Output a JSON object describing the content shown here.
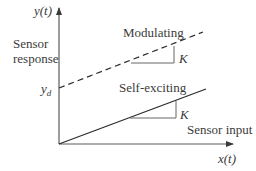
{
  "diagram": {
    "type": "sensor-response-comparison",
    "axes": {
      "y_label": "y(t)",
      "y_description": [
        "Sensor",
        "response"
      ],
      "x_label": "x(t)",
      "x_description": "Sensor input",
      "intercept_label_main": "y",
      "intercept_label_sub": "d"
    },
    "lines": [
      {
        "name": "Modulating",
        "style": "dashed",
        "start": [
          59,
          88
        ],
        "end": [
          203,
          32
        ],
        "slope_label": "K",
        "slope_triangle": {
          "x1": 131,
          "x2": 174,
          "y_base": 63,
          "y_top": 46
        }
      },
      {
        "name": "Self-exciting",
        "style": "solid",
        "start": [
          59,
          144
        ],
        "end": [
          206,
          89
        ],
        "slope_label": "K",
        "slope_triangle": {
          "x1": 130,
          "x2": 176,
          "y_base": 118,
          "y_top": 101
        }
      }
    ],
    "colors": {
      "line": "#2b2b2b",
      "axis": "#4a4a4a",
      "triangle": "#555555",
      "text": "#3a3a3a"
    }
  }
}
